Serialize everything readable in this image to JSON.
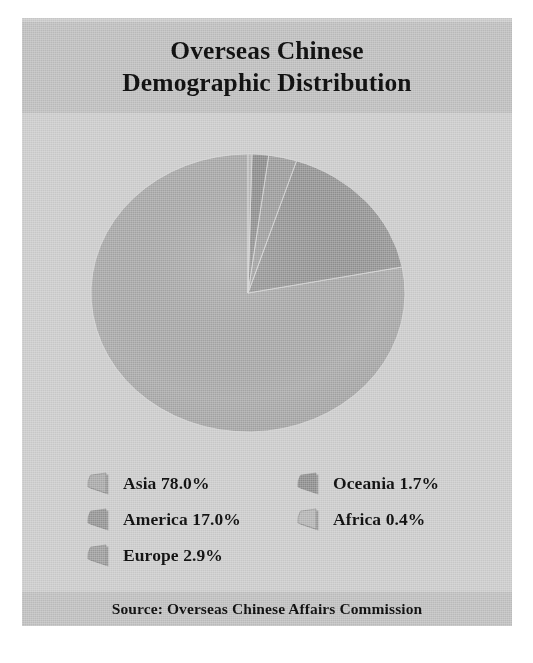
{
  "header": {
    "title_line1": "Overseas Chinese",
    "title_line2": "Demographic Distribution"
  },
  "footer": {
    "source": "Source: Overseas Chinese Affairs Commission"
  },
  "legend": {
    "left_column": [
      {
        "label": "Asia 78.0%",
        "color": "#a8a8a8"
      },
      {
        "label": "America 17.0%",
        "color": "#949494"
      },
      {
        "label": "Europe 2.9%",
        "color": "#9d9d9d"
      }
    ],
    "right_column": [
      {
        "label": "Oceania 1.7%",
        "color": "#8d8d8d"
      },
      {
        "label": "Africa 0.4%",
        "color": "#b4b4b4"
      }
    ]
  },
  "chart_data": {
    "type": "pie",
    "title": "Overseas Chinese Demographic Distribution",
    "source": "Source: Overseas Chinese Affairs Commission",
    "unit": "percent",
    "start_angle_deg": 0,
    "direction": "counterclockwise",
    "legend_position": "bottom",
    "grid": false,
    "categories": [
      "Asia",
      "America",
      "Europe",
      "Oceania",
      "Africa"
    ],
    "values": [
      78.0,
      17.0,
      2.9,
      1.7,
      0.4
    ],
    "labels": [
      "Asia 78.0%",
      "America 17.0%",
      "Europe 2.9%",
      "Oceania 1.7%",
      "Africa 0.4%"
    ],
    "colors": [
      "#a8a8a8",
      "#949494",
      "#9d9d9d",
      "#8d8d8d",
      "#b4b4b4"
    ],
    "slices": [
      {
        "name": "Asia",
        "value": 78.0,
        "color": "#a8a8a8"
      },
      {
        "name": "America",
        "value": 17.0,
        "color": "#949494"
      },
      {
        "name": "Europe",
        "value": 2.9,
        "color": "#9d9d9d"
      },
      {
        "name": "Oceania",
        "value": 1.7,
        "color": "#8d8d8d"
      },
      {
        "name": "Africa",
        "value": 0.4,
        "color": "#b4b4b4"
      }
    ],
    "total": 100.0
  },
  "palette": {
    "page_background": "#ffffff",
    "frame_background": "#c9c9c9",
    "band_background": "#bcbcbc",
    "plot_background": "#cacaca",
    "text": "#111111"
  }
}
